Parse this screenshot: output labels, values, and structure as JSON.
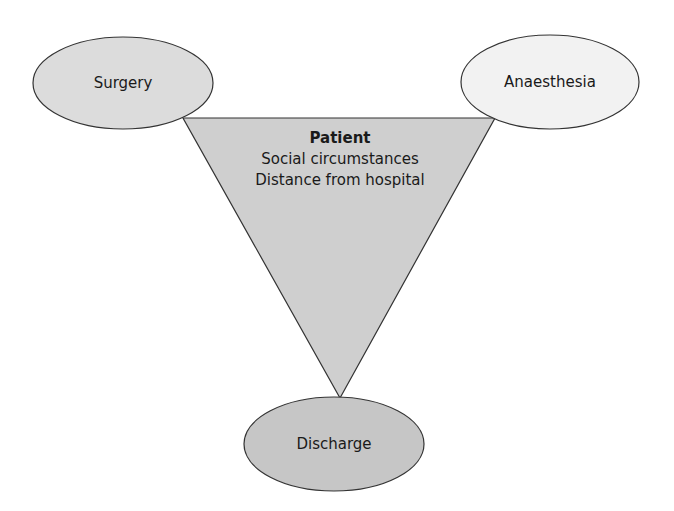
{
  "diagram": {
    "nodes": {
      "surgery": {
        "label": "Surgery",
        "fill": "#dcdcdc"
      },
      "anaesthesia": {
        "label": "Anaesthesia",
        "fill": "#f2f2f2"
      },
      "discharge": {
        "label": "Discharge",
        "fill": "#c6c6c6"
      }
    },
    "center": {
      "title": "Patient",
      "lines": [
        "Social circumstances",
        "Distance from hospital"
      ],
      "fill": "#cfcfcf"
    },
    "stroke": "#333333"
  }
}
